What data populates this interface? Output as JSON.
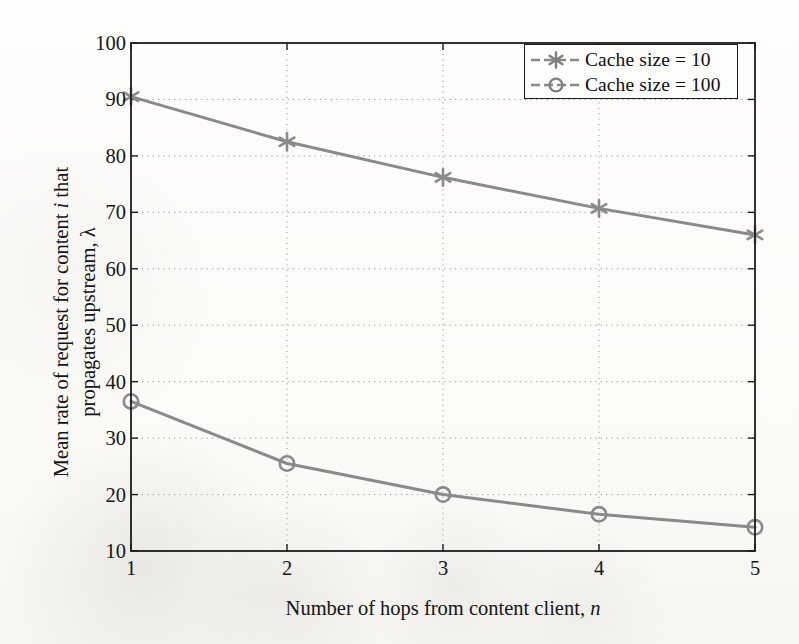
{
  "figure": {
    "background_color": "#fbfbf9",
    "line_color": "#8a8a8a",
    "axis_color": "#1c1c1c",
    "grid_color": "#9a9a9a"
  },
  "axes": {
    "x": {
      "label_prefix": "Number of hops from content client, ",
      "label_italic": "n",
      "ticks": [
        "1",
        "2",
        "3",
        "4",
        "5"
      ],
      "min": 1,
      "max": 5
    },
    "y": {
      "label_line1_prefix": "Mean rate of request for content ",
      "label_line1_italic": "i",
      "label_line1_suffix": " that",
      "label_line2": "propagates upstream, λ",
      "ticks": [
        "10",
        "20",
        "30",
        "40",
        "50",
        "60",
        "70",
        "80",
        "90",
        "100"
      ],
      "min": 10,
      "max": 100
    }
  },
  "legend": {
    "position": "top-right",
    "entries": [
      {
        "label": "Cache size = 10",
        "marker": "asterisk-marker"
      },
      {
        "label": "Cache size = 100",
        "marker": "circle-marker"
      }
    ]
  },
  "chart_data": {
    "type": "line",
    "title": "",
    "xlabel": "Number of hops from content client, n",
    "ylabel": "Mean rate of request for content i that propagates upstream, λ",
    "x": [
      1,
      2,
      3,
      4,
      5
    ],
    "xlim": [
      1,
      5
    ],
    "ylim": [
      10,
      100
    ],
    "xticks": [
      1,
      2,
      3,
      4,
      5
    ],
    "yticks": [
      10,
      20,
      30,
      40,
      50,
      60,
      70,
      80,
      90,
      100
    ],
    "grid": true,
    "legend_position": "upper right",
    "series": [
      {
        "name": "Cache size = 10",
        "marker": "asterisk",
        "color": "#8a8a8a",
        "values": [
          90.5,
          82.5,
          76.2,
          70.7,
          66.0
        ]
      },
      {
        "name": "Cache size = 100",
        "marker": "circle",
        "color": "#8a8a8a",
        "values": [
          36.5,
          25.5,
          20.0,
          16.5,
          14.2
        ]
      }
    ]
  }
}
